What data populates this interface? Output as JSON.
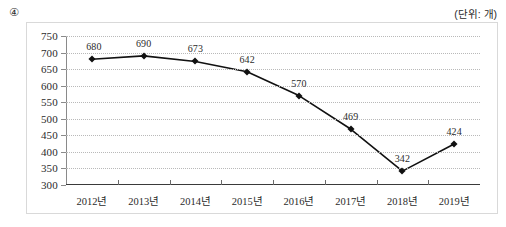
{
  "item_number": "④",
  "unit_label": "(단위: 개)",
  "chart_data": {
    "type": "line",
    "title": "",
    "xlabel": "",
    "ylabel": "",
    "categories": [
      "2012년",
      "2013년",
      "2014년",
      "2015년",
      "2016년",
      "2017년",
      "2018년",
      "2019년"
    ],
    "values": [
      680,
      690,
      673,
      642,
      570,
      469,
      342,
      424
    ],
    "data_labels": [
      "680",
      "690",
      "673",
      "642",
      "570",
      "469",
      "342",
      "424"
    ],
    "ylim": [
      300,
      750
    ],
    "yticks": [
      300,
      350,
      400,
      450,
      500,
      550,
      600,
      650,
      700,
      750
    ],
    "ytick_labels": [
      "300",
      "350",
      "400",
      "450",
      "500",
      "550",
      "600",
      "650",
      "700",
      "750"
    ],
    "grid": true,
    "legend": false,
    "series_color": "#111111",
    "grid_color": "#b9b9b9",
    "axis_color": "#3a3a3a"
  }
}
